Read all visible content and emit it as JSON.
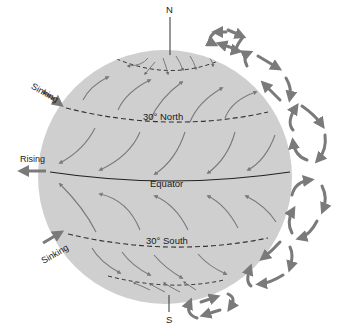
{
  "colors": {
    "globe_fill": "#cfcfcf",
    "arrow": "#7a7a7a",
    "line": "#333333",
    "text": "#1a1a1a"
  },
  "labels": {
    "north_pole": "N",
    "south_pole": "S",
    "lat_30n": "30° North",
    "equator": "Equator",
    "lat_30s": "30° South",
    "sinking_north": "Sinking",
    "rising": "Rising",
    "sinking_south": "Sinking"
  },
  "latitude_lines": [
    {
      "name": "polar-north",
      "style": "dashed"
    },
    {
      "name": "30-north",
      "style": "dashed"
    },
    {
      "name": "equator",
      "style": "solid"
    },
    {
      "name": "30-south",
      "style": "dashed"
    },
    {
      "name": "polar-south",
      "style": "dashed"
    }
  ],
  "circulation_cells": [
    {
      "name": "polar-cell-north"
    },
    {
      "name": "ferrel-cell-north"
    },
    {
      "name": "hadley-cell-north"
    },
    {
      "name": "hadley-cell-south"
    },
    {
      "name": "ferrel-cell-south"
    },
    {
      "name": "polar-cell-south"
    }
  ]
}
